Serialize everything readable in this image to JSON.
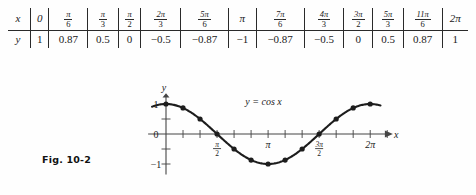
{
  "figure": {
    "caption": "Fig. 10-2",
    "equation_label": "y = cos x"
  },
  "table": {
    "row_labels": {
      "x": "x",
      "y": "y"
    },
    "x_values": [
      {
        "type": "int",
        "text": "0"
      },
      {
        "type": "frac",
        "num": "π",
        "den": "6"
      },
      {
        "type": "frac",
        "num": "π",
        "den": "3"
      },
      {
        "type": "frac",
        "num": "π",
        "den": "2"
      },
      {
        "type": "frac",
        "num": "2π",
        "den": "3"
      },
      {
        "type": "frac",
        "num": "5π",
        "den": "6"
      },
      {
        "type": "int",
        "text": "π"
      },
      {
        "type": "frac",
        "num": "7π",
        "den": "6"
      },
      {
        "type": "frac",
        "num": "4π",
        "den": "3"
      },
      {
        "type": "frac",
        "num": "3π",
        "den": "2"
      },
      {
        "type": "frac",
        "num": "5π",
        "den": "3"
      },
      {
        "type": "frac",
        "num": "11π",
        "den": "6"
      },
      {
        "type": "int",
        "text": "2π"
      }
    ],
    "y_values": [
      "1",
      "0.87",
      "0.5",
      "0",
      "−0.5",
      "−0.87",
      "−1",
      "−0.87",
      "−0.5",
      "0",
      "0.5",
      "0.87",
      "1"
    ]
  },
  "axes": {
    "x_axis_label": "x",
    "y_axis_label": "y",
    "x_tick_labels": [
      {
        "text": "π",
        "sub": "2",
        "frac": true,
        "at": 1.5707963
      },
      {
        "text": "π",
        "frac": false,
        "at": 3.1415927
      },
      {
        "text": "3π",
        "sub": "2",
        "frac": true,
        "at": 4.712389
      },
      {
        "text": "2π",
        "frac": false,
        "at": 6.2831853
      }
    ],
    "y_tick_labels": [
      {
        "text": "1",
        "at": 1
      },
      {
        "text": "0",
        "at": 0
      },
      {
        "text": "−1",
        "at": -1
      }
    ]
  },
  "chart_data": {
    "type": "line",
    "title": "y = cos x",
    "xlabel": "x",
    "ylabel": "y",
    "xlim": [
      -0.55,
      6.95
    ],
    "ylim": [
      -1.25,
      1.25
    ],
    "grid": false,
    "legend": "none",
    "x_tick_values": [
      1.5707963,
      3.1415927,
      4.712389,
      6.2831853
    ],
    "y_tick_values": [
      -1,
      -0.5,
      0.5,
      1
    ],
    "markers": true,
    "x": [
      0,
      0.5235988,
      1.0471976,
      1.5707963,
      2.0943951,
      2.6179939,
      3.1415927,
      3.6651914,
      4.1887902,
      4.712389,
      5.2359878,
      5.7595865,
      6.2831853
    ],
    "values": [
      1,
      0.87,
      0.5,
      0,
      -0.5,
      -0.87,
      -1,
      -0.87,
      -0.5,
      0,
      0.5,
      0.87,
      1
    ]
  },
  "colors": {
    "curve": "#1d1d1d",
    "axis": "#444444",
    "background": "#fefefe"
  }
}
